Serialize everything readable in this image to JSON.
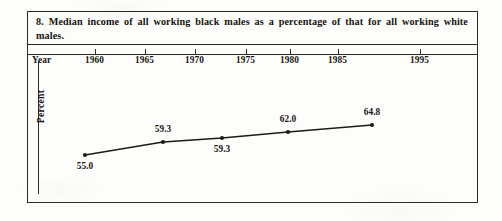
{
  "figure": {
    "number": "8.",
    "caption": "8. Median income of all working black males as a percentage of that for all working white males.",
    "axis_row_header": "Year",
    "y_axis_title": "Percent",
    "ink_color": "#2c2a27",
    "page_color": "#fdfdfc"
  },
  "chart_data": {
    "type": "line",
    "title": "Median income of all working black males as a percentage of that for all working white males.",
    "xlabel": "Year",
    "ylabel": "Percent",
    "x_tick_labels": [
      "1960",
      "1965",
      "1970",
      "1975",
      "1980",
      "1985",
      "1995"
    ],
    "categories": [
      "1960",
      "1970",
      "1975",
      "1985",
      "1995"
    ],
    "values": [
      55.0,
      59.3,
      59.3,
      62.0,
      64.8
    ],
    "point_labels": [
      "55.0",
      "59.3",
      "59.3",
      "62.0",
      "64.8"
    ],
    "label_positions": [
      "below",
      "above",
      "below",
      "above",
      "above"
    ],
    "grid": false,
    "legend": false,
    "marker": "filled-circle",
    "line_color": "#1d1b18"
  },
  "geometry": {
    "x_ticks_px": [
      67,
      117,
      167,
      218,
      262,
      310,
      392
    ],
    "points_px": [
      {
        "x": 57,
        "y": 94,
        "label": "55.0",
        "label_x": 57,
        "label_y": 100
      },
      {
        "x": 135,
        "y": 81,
        "label": "59.3",
        "label_x": 135,
        "label_y": 63
      },
      {
        "x": 194,
        "y": 77,
        "label": "59.3",
        "label_x": 194,
        "label_y": 83
      },
      {
        "x": 260,
        "y": 71,
        "label": "62.0",
        "label_x": 260,
        "label_y": 53
      },
      {
        "x": 344,
        "y": 64,
        "label": "64.8",
        "label_x": 344,
        "label_y": 46
      }
    ]
  }
}
